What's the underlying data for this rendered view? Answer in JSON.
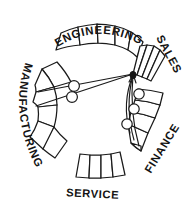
{
  "diagram": {
    "kind": "hand-drawn hub-and-spoke organization wheel",
    "background_color": "#ffffff",
    "ink_color": "#141414",
    "hub": {
      "label_semantic": "hub-node",
      "x": 133,
      "y": 74
    },
    "departments": [
      {
        "id": "engineering",
        "label": "ENGINEERING",
        "position": "top",
        "segment_count": 5,
        "label_rotation_deg": -18
      },
      {
        "id": "sales",
        "label": "SALES",
        "position": "upper-right",
        "segment_count": 4,
        "label_rotation_deg": 62
      },
      {
        "id": "finance",
        "label": "FINANCE",
        "position": "lower-right",
        "segment_count": 5,
        "label_rotation_deg": -52
      },
      {
        "id": "service",
        "label": "SERVICE",
        "position": "bottom",
        "segment_count": 4,
        "label_rotation_deg": 5
      },
      {
        "id": "manufacturing",
        "label": "MANUFACTURING",
        "position": "left",
        "segment_count": 5,
        "label_rotation_deg": 80
      }
    ],
    "connectors": [
      {
        "id": "hub-to-manufacturing-upper",
        "style": "straight",
        "node_count": 1
      },
      {
        "id": "hub-to-manufacturing-lower",
        "style": "straight",
        "node_count": 1
      },
      {
        "id": "hub-to-finance-curve",
        "style": "curved",
        "node_count": 3
      }
    ],
    "nodes": [
      {
        "id": "node-manufacturing-1",
        "x": 74,
        "y": 86
      },
      {
        "id": "node-manufacturing-2",
        "x": 72,
        "y": 97
      },
      {
        "id": "node-finance-1",
        "x": 140,
        "y": 94
      },
      {
        "id": "node-finance-2",
        "x": 135,
        "y": 109
      },
      {
        "id": "node-finance-3",
        "x": 127,
        "y": 124
      }
    ]
  }
}
